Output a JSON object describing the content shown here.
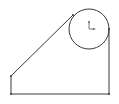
{
  "sketch": {
    "background": "#ffffff",
    "stroke_color": "#3a3a3a",
    "circle": {
      "cx": 89,
      "cy": 29,
      "r": 20
    },
    "lines": [
      {
        "name": "left-edge",
        "x1": 11,
        "y1": 76,
        "x2": 11,
        "y2": 94
      },
      {
        "name": "bottom-edge",
        "x1": 11,
        "y1": 94,
        "x2": 109,
        "y2": 94
      },
      {
        "name": "right-edge",
        "x1": 109,
        "y1": 29,
        "x2": 109,
        "y2": 94
      },
      {
        "name": "tangent-line",
        "x1": 11,
        "y1": 76,
        "x2": 73,
        "y2": 15
      }
    ],
    "origin_marker": {
      "x": 89,
      "y": 29
    }
  }
}
